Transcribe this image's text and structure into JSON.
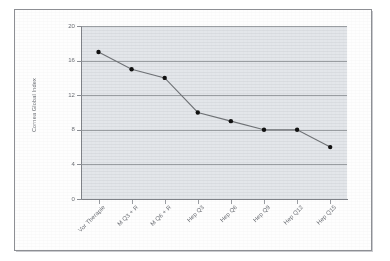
{
  "figure": {
    "background_color": "#ffffff",
    "frame_color": "#8d8f94",
    "plot_background_color": "#e3e6ea",
    "gridline_color": "#8a8d93",
    "series_color": "#111111",
    "line_color": "#6f7276"
  },
  "chart_data": {
    "type": "line",
    "title": "",
    "xlabel": "",
    "ylabel": "Cornea Global Index",
    "categories": [
      "Vor Therapie",
      "M Q3 + R",
      "M Q6 + R",
      "Hep Q3",
      "Hep Q6",
      "Hep Q9",
      "Hep Q12",
      "Hep Q15"
    ],
    "values": [
      17,
      15,
      14,
      10,
      9,
      8,
      8,
      6
    ],
    "ylim": [
      0,
      20
    ],
    "yticks": [
      0,
      4,
      8,
      12,
      16,
      20
    ],
    "ytick_labels": [
      "0",
      "4",
      "8",
      "12",
      "16",
      "20"
    ],
    "grid": true,
    "grid_axis": "y",
    "legend": false,
    "legend_position": "none",
    "marker": "filled-circle",
    "series": [
      {
        "name": "Cornea Global Index",
        "values": [
          17,
          15,
          14,
          10,
          9,
          8,
          8,
          6
        ]
      }
    ]
  }
}
